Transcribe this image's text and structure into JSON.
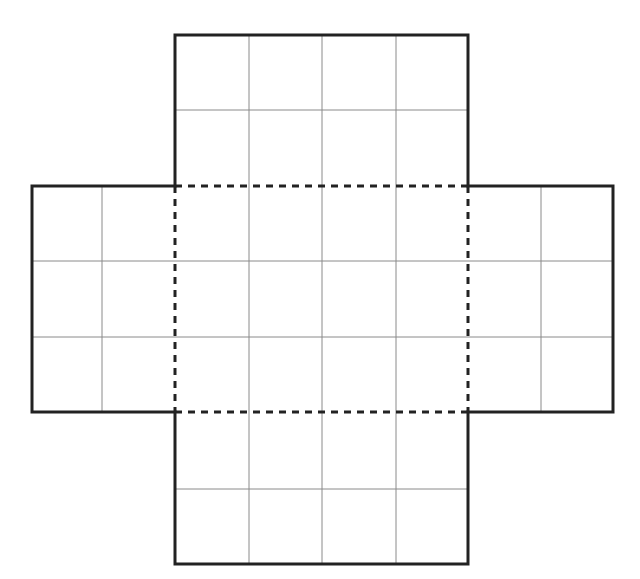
{
  "diagram": {
    "type": "box-net",
    "grid": {
      "columns": 8,
      "rows": 7
    },
    "center_base": {
      "col": 2,
      "row": 2,
      "width_cells": 4,
      "height_cells": 3,
      "fold_style": "dashed"
    },
    "flaps": [
      {
        "name": "top",
        "col": 2,
        "row": 0,
        "width_cells": 4,
        "height_cells": 2
      },
      {
        "name": "left",
        "col": 0,
        "row": 2,
        "width_cells": 2,
        "height_cells": 3
      },
      {
        "name": "right",
        "col": 6,
        "row": 2,
        "width_cells": 2,
        "height_cells": 3
      },
      {
        "name": "bottom",
        "col": 2,
        "row": 5,
        "width_cells": 4,
        "height_cells": 2
      }
    ],
    "colors": {
      "outline": "#222222",
      "grid": "#8a8a8a",
      "background": "#ffffff"
    }
  }
}
